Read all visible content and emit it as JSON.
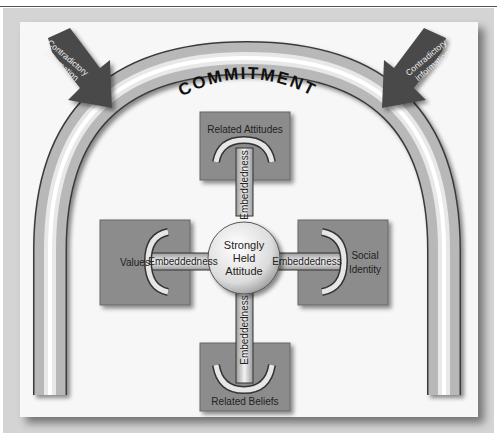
{
  "diagram": {
    "arch": {
      "label": "COMMITMENT"
    },
    "arrows": [
      {
        "id": "left",
        "label_line1": "Contradictory",
        "label_line2": "information"
      },
      {
        "id": "right",
        "label_line1": "Contradictory",
        "label_line2": "information"
      }
    ],
    "center": {
      "line1": "Strongly",
      "line2": "Held",
      "line3": "Attitude"
    },
    "nodes": {
      "top": {
        "label": "Related Attitudes"
      },
      "left": {
        "label": "Values"
      },
      "right": {
        "line1": "Social",
        "line2": "Identity"
      },
      "bottom": {
        "label": "Related Beliefs"
      }
    },
    "connectors": {
      "top": "Embeddedness",
      "left": "Embeddedness",
      "right": "Embeddedness",
      "bottom": "Embeddedness"
    },
    "colors": {
      "box": "#8c8c8c",
      "arrow": "#4a4a4a",
      "arch_light": "#f2f2f2",
      "arch_dark": "#6a6a6a",
      "background": "#f7f7f7"
    }
  }
}
